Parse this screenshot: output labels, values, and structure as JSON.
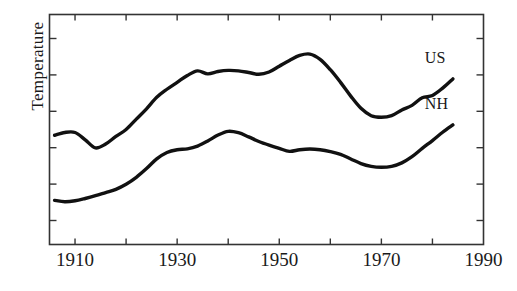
{
  "chart_data": {
    "type": "line",
    "title": "",
    "xlabel": "",
    "ylabel": "Temperature",
    "xlim": [
      1905,
      1990
    ],
    "ylim": [
      0,
      1
    ],
    "grid": false,
    "legend_position": "inline-right",
    "xticks": [
      1910,
      1920,
      1930,
      1940,
      1950,
      1960,
      1970,
      1980
    ],
    "xtick_labels": [
      "1910",
      "1930",
      "1950",
      "1970",
      "1990"
    ],
    "xtick_label_values": [
      1910,
      1930,
      1950,
      1970,
      1990
    ],
    "yticks_count": 6,
    "ytick_labels": [],
    "series": [
      {
        "name": "US",
        "label": "US",
        "color": "#111111",
        "x": [
          1906,
          1908,
          1910,
          1912,
          1914,
          1916,
          1918,
          1920,
          1922,
          1924,
          1926,
          1928,
          1930,
          1932,
          1934,
          1936,
          1938,
          1940,
          1942,
          1944,
          1946,
          1948,
          1950,
          1952,
          1954,
          1956,
          1958,
          1960,
          1962,
          1964,
          1966,
          1968,
          1970,
          1972,
          1974,
          1976,
          1978,
          1980,
          1982,
          1984
        ],
        "y": [
          0.475,
          0.487,
          0.487,
          0.455,
          0.42,
          0.437,
          0.47,
          0.5,
          0.545,
          0.59,
          0.64,
          0.675,
          0.705,
          0.735,
          0.755,
          0.742,
          0.752,
          0.757,
          0.755,
          0.748,
          0.74,
          0.75,
          0.775,
          0.8,
          0.822,
          0.828,
          0.805,
          0.76,
          0.705,
          0.645,
          0.592,
          0.56,
          0.553,
          0.56,
          0.585,
          0.605,
          0.638,
          0.648,
          0.68,
          0.72
        ]
      },
      {
        "name": "NH",
        "label": "NH",
        "color": "#111111",
        "x": [
          1906,
          1908,
          1910,
          1912,
          1914,
          1916,
          1918,
          1920,
          1922,
          1924,
          1926,
          1928,
          1930,
          1932,
          1934,
          1936,
          1938,
          1940,
          1942,
          1944,
          1946,
          1948,
          1950,
          1952,
          1954,
          1956,
          1958,
          1960,
          1962,
          1964,
          1966,
          1968,
          1970,
          1972,
          1974,
          1976,
          1978,
          1980,
          1982,
          1984
        ],
        "y": [
          0.192,
          0.186,
          0.19,
          0.2,
          0.212,
          0.226,
          0.24,
          0.262,
          0.292,
          0.33,
          0.372,
          0.4,
          0.412,
          0.416,
          0.428,
          0.45,
          0.476,
          0.492,
          0.486,
          0.468,
          0.448,
          0.432,
          0.418,
          0.405,
          0.412,
          0.415,
          0.412,
          0.404,
          0.392,
          0.372,
          0.352,
          0.34,
          0.336,
          0.34,
          0.355,
          0.382,
          0.418,
          0.452,
          0.488,
          0.52
        ]
      }
    ]
  },
  "axis": {
    "ylabel": "Temperature"
  }
}
